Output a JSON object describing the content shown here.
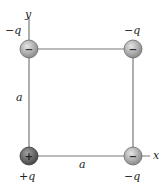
{
  "diagram": {
    "title": "",
    "axes": {
      "x_label": "x",
      "y_label": "y"
    },
    "side_labels": {
      "left": "a",
      "bottom": "a"
    },
    "charges": [
      {
        "id": "top-left",
        "label": "−q",
        "sign": "−",
        "polarity": "negative",
        "cx": 29,
        "cy": 49
      },
      {
        "id": "top-right",
        "label": "−q",
        "sign": "−",
        "polarity": "negative",
        "cx": 133,
        "cy": 49
      },
      {
        "id": "bottom-left",
        "label": "+q",
        "sign": "+",
        "polarity": "positive",
        "cx": 29,
        "cy": 156
      },
      {
        "id": "bottom-right",
        "label": "−q",
        "sign": "−",
        "polarity": "negative",
        "cx": 133,
        "cy": 156
      }
    ],
    "colors": {
      "line": "#7a7a7a",
      "negative_fill_light": "#d8d8d8",
      "negative_fill_dark": "#8a8a8a",
      "positive_fill_light": "#9a9a9a",
      "positive_fill_dark": "#4a4a4a"
    }
  }
}
